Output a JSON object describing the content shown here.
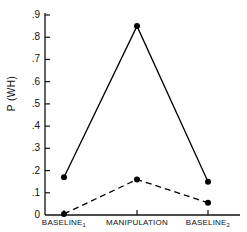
{
  "chart_data": {
    "type": "line",
    "title": "",
    "xlabel": "",
    "ylabel": "P (WH)",
    "categories": [
      "BASELINE",
      "MANIPULATION",
      "BASELINE"
    ],
    "category_labels": [
      "BASELINE₁",
      "MANIPULATION",
      "BASELINE₂"
    ],
    "category_subscripts": [
      "1",
      "",
      "2"
    ],
    "category_bases": [
      "BASELINE",
      "MANIPULATION",
      "BASELINE"
    ],
    "ylim": [
      0,
      0.9
    ],
    "ytick_values": [
      0,
      0.1,
      0.2,
      0.3,
      0.4,
      0.5,
      0.6,
      0.7,
      0.8,
      0.9
    ],
    "ytick_labels": [
      "0",
      ".1",
      ".2",
      ".3",
      ".4",
      ".5",
      ".6",
      ".7",
      ".8",
      ".9"
    ],
    "grid": false,
    "legend": "none",
    "series": [
      {
        "name": "solid",
        "style": "solid",
        "marker": "filled-circle",
        "color": "#000000",
        "values": [
          0.17,
          0.85,
          0.15
        ]
      },
      {
        "name": "dashed",
        "style": "dashed",
        "marker": "filled-circle",
        "color": "#000000",
        "values": [
          0.005,
          0.16,
          0.055
        ]
      }
    ]
  },
  "axes": {
    "y_axis_name": "p-axis",
    "x_axis_name": "condition-axis"
  }
}
